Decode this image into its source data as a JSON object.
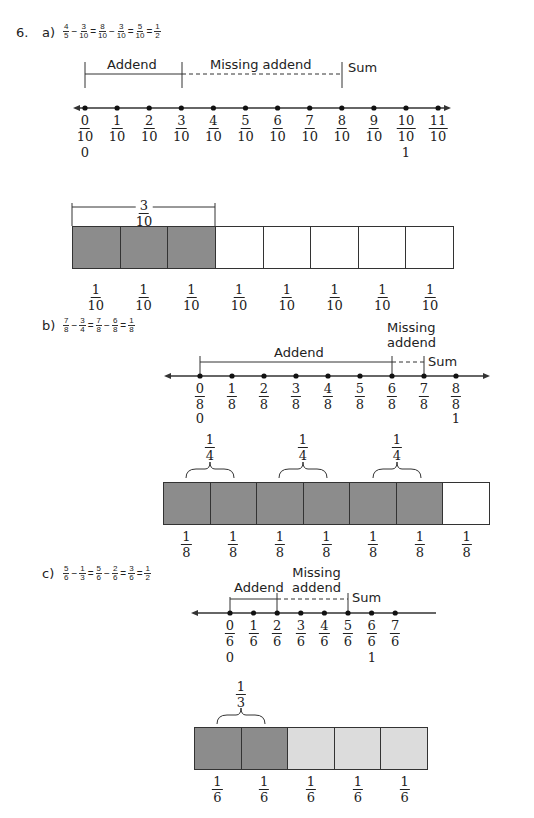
{
  "problem_number": "6.",
  "parts": {
    "a": {
      "label": "a)",
      "equation": [
        {
          "n": "4",
          "d": "5"
        },
        "−",
        {
          "n": "3",
          "d": "10"
        },
        "=",
        {
          "n": "8",
          "d": "10"
        },
        "−",
        {
          "n": "3",
          "d": "10"
        },
        "=",
        {
          "n": "5",
          "d": "10"
        },
        "=",
        {
          "n": "1",
          "d": "2"
        }
      ],
      "addend_label": "Addend",
      "missing_label": "Missing addend",
      "sum_label": "Sum",
      "ticks": [
        {
          "n": "0",
          "d": "10"
        },
        {
          "n": "1",
          "d": "10"
        },
        {
          "n": "2",
          "d": "10"
        },
        {
          "n": "3",
          "d": "10"
        },
        {
          "n": "4",
          "d": "10"
        },
        {
          "n": "5",
          "d": "10"
        },
        {
          "n": "6",
          "d": "10"
        },
        {
          "n": "7",
          "d": "10"
        },
        {
          "n": "8",
          "d": "10"
        },
        {
          "n": "9",
          "d": "10"
        },
        {
          "n": "10",
          "d": "10"
        },
        {
          "n": "11",
          "d": "10"
        }
      ],
      "whole_zero": "0",
      "whole_one": "1",
      "bar_brace": {
        "n": "3",
        "d": "10"
      },
      "bar_cells": [
        {
          "n": "1",
          "d": "10",
          "shade": "dark"
        },
        {
          "n": "1",
          "d": "10",
          "shade": "dark"
        },
        {
          "n": "1",
          "d": "10",
          "shade": "dark"
        },
        {
          "n": "1",
          "d": "10",
          "shade": "none"
        },
        {
          "n": "1",
          "d": "10",
          "shade": "none"
        },
        {
          "n": "1",
          "d": "10",
          "shade": "none"
        },
        {
          "n": "1",
          "d": "10",
          "shade": "none"
        },
        {
          "n": "1",
          "d": "10",
          "shade": "none"
        }
      ]
    },
    "b": {
      "label": "b)",
      "equation": [
        {
          "n": "7",
          "d": "8"
        },
        "−",
        {
          "n": "3",
          "d": "4"
        },
        "=",
        {
          "n": "7",
          "d": "8"
        },
        "−",
        {
          "n": "6",
          "d": "8"
        },
        "=",
        {
          "n": "1",
          "d": "8"
        }
      ],
      "addend_label": "Addend",
      "missing_label_line1": "Missing",
      "missing_label_line2": "addend",
      "sum_label": "Sum",
      "ticks": [
        {
          "n": "0",
          "d": "8"
        },
        {
          "n": "1",
          "d": "8"
        },
        {
          "n": "2",
          "d": "8"
        },
        {
          "n": "3",
          "d": "8"
        },
        {
          "n": "4",
          "d": "8"
        },
        {
          "n": "5",
          "d": "8"
        },
        {
          "n": "6",
          "d": "8"
        },
        {
          "n": "7",
          "d": "8"
        },
        {
          "n": "8",
          "d": "8"
        }
      ],
      "whole_zero": "0",
      "whole_one": "1",
      "brace_labels": [
        {
          "n": "1",
          "d": "4"
        },
        {
          "n": "1",
          "d": "4"
        },
        {
          "n": "1",
          "d": "4"
        }
      ],
      "bar_cells": [
        {
          "n": "1",
          "d": "8",
          "shade": "dark"
        },
        {
          "n": "1",
          "d": "8",
          "shade": "dark"
        },
        {
          "n": "1",
          "d": "8",
          "shade": "dark"
        },
        {
          "n": "1",
          "d": "8",
          "shade": "dark"
        },
        {
          "n": "1",
          "d": "8",
          "shade": "dark"
        },
        {
          "n": "1",
          "d": "8",
          "shade": "dark"
        },
        {
          "n": "1",
          "d": "8",
          "shade": "none"
        }
      ]
    },
    "c": {
      "label": "c)",
      "equation": [
        {
          "n": "5",
          "d": "6"
        },
        "−",
        {
          "n": "1",
          "d": "3"
        },
        "=",
        {
          "n": "5",
          "d": "6"
        },
        "−",
        {
          "n": "2",
          "d": "6"
        },
        "=",
        {
          "n": "3",
          "d": "6"
        },
        "=",
        {
          "n": "1",
          "d": "2"
        }
      ],
      "addend_label": "Addend",
      "missing_label_line1": "Missing",
      "missing_label_line2": "addend",
      "sum_label": "Sum",
      "ticks": [
        {
          "n": "0",
          "d": "6"
        },
        {
          "n": "1",
          "d": "6"
        },
        {
          "n": "2",
          "d": "6"
        },
        {
          "n": "3",
          "d": "6"
        },
        {
          "n": "4",
          "d": "6"
        },
        {
          "n": "5",
          "d": "6"
        },
        {
          "n": "6",
          "d": "6"
        },
        {
          "n": "7",
          "d": "6"
        }
      ],
      "whole_zero": "0",
      "whole_one": "1",
      "brace_label": {
        "n": "1",
        "d": "3"
      },
      "bar_cells": [
        {
          "n": "1",
          "d": "6",
          "shade": "dark"
        },
        {
          "n": "1",
          "d": "6",
          "shade": "dark"
        },
        {
          "n": "1",
          "d": "6",
          "shade": "light"
        },
        {
          "n": "1",
          "d": "6",
          "shade": "light"
        },
        {
          "n": "1",
          "d": "6",
          "shade": "light"
        }
      ]
    }
  },
  "colors": {
    "dark": "#8c8c8c",
    "light": "#dcdcdc",
    "none": "#ffffff",
    "line": "#333333"
  }
}
